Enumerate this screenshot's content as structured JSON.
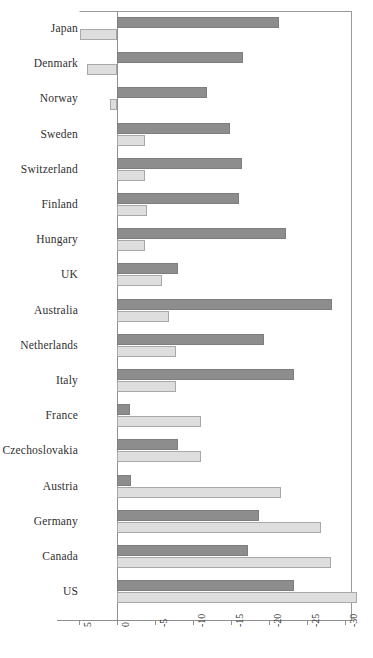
{
  "chart_data": {
    "type": "bar",
    "orientation": "horizontal",
    "title": "",
    "subtitle": "",
    "xlabel": "",
    "ylabel": "",
    "xlim": [
      5,
      -35
    ],
    "xticks": [
      5,
      0,
      -5,
      -10,
      -15,
      -20,
      -25,
      -30,
      -35
    ],
    "xtick_labels": [
      "5",
      "0",
      "-5",
      "-10",
      "-15",
      "-20",
      "-25",
      "-30",
      "-35"
    ],
    "grid": false,
    "legend": "none",
    "axis_direction": "reversed (positive left, negative right)",
    "categories": [
      "Japan",
      "Denmark",
      "Norway",
      "Sweden",
      "Switzerland",
      "Finland",
      "Hungary",
      "UK",
      "Australia",
      "Netherlands",
      "Italy",
      "France",
      "Czechoslovakia",
      "Austria",
      "Germany",
      "Canada",
      "US"
    ],
    "series": [
      {
        "name": "series-dark",
        "color": "#8d8d8d",
        "values": [
          -21.3,
          -16.6,
          -11.9,
          -14.9,
          -16.4,
          -16.1,
          -22.3,
          -8.0,
          -28.3,
          -19.4,
          -23.3,
          -1.7,
          -8.0,
          -1.9,
          -18.7,
          -17.3,
          -23.3
        ]
      },
      {
        "name": "series-light",
        "color": "#dedede",
        "values": [
          4.9,
          4.0,
          0.9,
          -3.7,
          -3.7,
          -3.9,
          -3.7,
          -5.9,
          -6.9,
          -7.7,
          -7.7,
          -11.0,
          -11.0,
          -21.6,
          -26.9,
          -28.1,
          -31.6
        ]
      }
    ]
  }
}
